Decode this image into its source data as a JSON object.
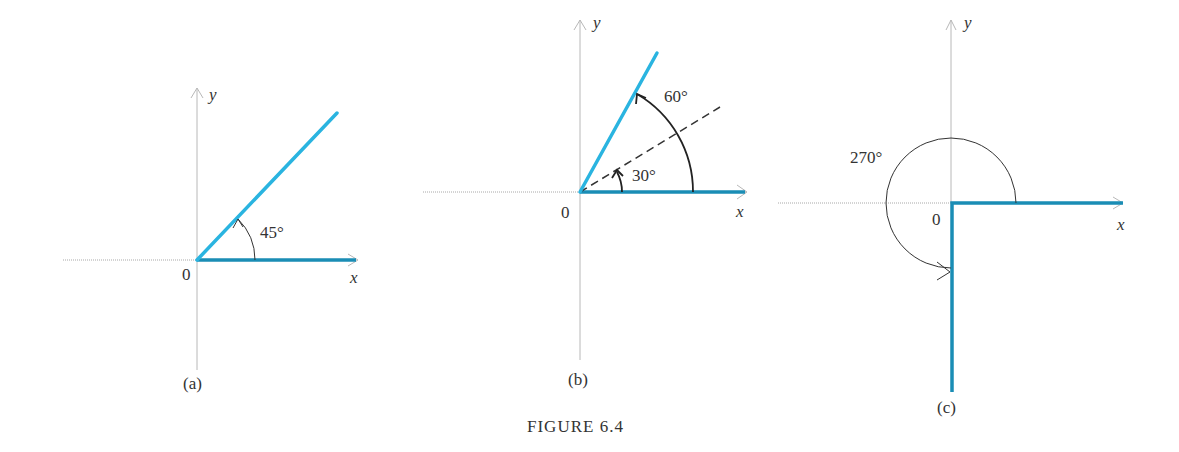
{
  "figure": {
    "caption": "FIGURE 6.4"
  },
  "panels": [
    {
      "id": "a",
      "label": "(a)",
      "origin_label": "0",
      "x_label": "x",
      "y_label": "y",
      "angle_label": "45°",
      "angle_deg": 45,
      "ray_color": "#2ab4e0"
    },
    {
      "id": "b",
      "label": "(b)",
      "origin_label": "0",
      "x_label": "x",
      "y_label": "y",
      "angle_label_outer": "60°",
      "angle_label_inner": "30°",
      "angle_deg": 60,
      "reference_angle_deg": 30,
      "ray_color": "#2ab4e0"
    },
    {
      "id": "c",
      "label": "(c)",
      "origin_label": "0",
      "x_label": "x",
      "y_label": "y",
      "angle_label": "270°",
      "angle_deg": 270,
      "ray_color": "#2ab4e0"
    }
  ]
}
